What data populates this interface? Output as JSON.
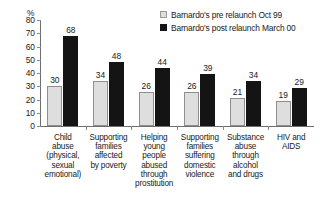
{
  "chart_data": {
    "type": "bar",
    "title": "",
    "subtitle": "",
    "xlabel": "",
    "ylabel": "%",
    "ylim": [
      0,
      80
    ],
    "ytick_step": 10,
    "yticks": [
      0,
      10,
      20,
      30,
      40,
      50,
      60,
      70,
      80
    ],
    "grid": false,
    "legend_position": "top-right",
    "categories": [
      "Child abuse (physical, sexual emotional)",
      "Supporting families affected by poverty",
      "Helping young people abused through prostitution",
      "Supporting families suffering domestic violence",
      "Substance abuse through alcohol and drugs",
      "HIV and AIDS"
    ],
    "category_lines": [
      [
        "Child",
        "abuse",
        "(physical,",
        "sexual",
        "emotional)"
      ],
      [
        "Supporting",
        "families",
        "affected",
        "by poverty"
      ],
      [
        "Helping",
        "young",
        "people",
        "abused",
        "through",
        "prostitution"
      ],
      [
        "Supporting",
        "families",
        "suffering",
        "domestic",
        "violence"
      ],
      [
        "Substance",
        "abuse",
        "through",
        "alcohol",
        "and drugs"
      ],
      [
        "HIV and",
        "AIDS"
      ]
    ],
    "series": [
      {
        "name": "Barnardo's pre relaunch Oct 99",
        "color": "#dedede",
        "values": [
          30,
          34,
          26,
          26,
          21,
          19
        ]
      },
      {
        "name": "Barnardo's post relaunch March 00",
        "color": "#141414",
        "values": [
          68,
          48,
          44,
          39,
          34,
          29
        ]
      }
    ]
  },
  "legend": {
    "items": [
      {
        "label": "Barnardo's pre relaunch Oct 99",
        "swatch": "pre"
      },
      {
        "label": "Barnardo's post relaunch March 00",
        "swatch": "post"
      }
    ]
  },
  "axis": {
    "unit_label": "%"
  },
  "colors": {
    "pre_fill": "#dedede",
    "pre_stroke": "#8f8f8f",
    "post_fill": "#141414",
    "axis": "#6e6e6e",
    "text": "#1a1a1a",
    "background": "#ffffff"
  }
}
